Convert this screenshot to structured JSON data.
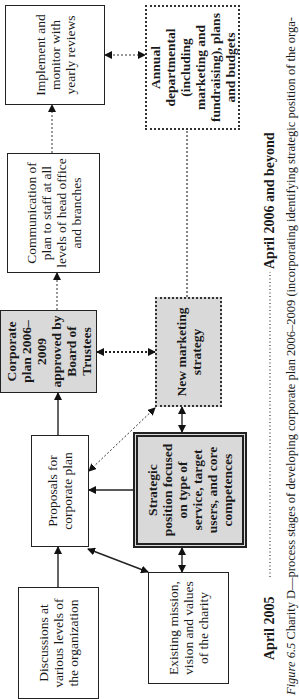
{
  "diagram": {
    "orientation": "rotated 90° counter-clockwise",
    "boxes": {
      "discussions": "Discussions at various levels of the organization",
      "existing_mission": "Existing mission, vision and values of the charity",
      "proposals": "Proposals for corporate plan",
      "strategic_position": "Strategic position focused on type of service, target users, and core competences",
      "corporate_plan": "Corporate plan 2006–2009 approved by Board of Trustees",
      "new_marketing": "New marketing strategy",
      "communication": "Communication of plan to staff at all levels of head office and branches",
      "annual_departmental": "Annual departmental (including marketing and fundraising), plans and budgets",
      "implement": "Implement and monitor with yearly reviews"
    },
    "timeline": {
      "start_label": "April 2005",
      "end_label": "April 2006 and beyond"
    },
    "connections": [
      {
        "from": "discussions",
        "to": "proposals",
        "style": "solid",
        "direction": "forward"
      },
      {
        "from": "proposals",
        "to": "existing_mission",
        "style": "solid",
        "direction": "both"
      },
      {
        "from": "strategic_position",
        "to": "proposals",
        "style": "solid",
        "direction": "forward"
      },
      {
        "from": "existing_mission",
        "to": "strategic_position",
        "style": "solid",
        "direction": "both"
      },
      {
        "from": "strategic_position",
        "to": "new_marketing",
        "style": "solid",
        "direction": "both"
      },
      {
        "from": "new_marketing",
        "to": "proposals",
        "style": "dotted",
        "direction": "both"
      },
      {
        "from": "proposals",
        "to": "corporate_plan",
        "style": "solid",
        "direction": "forward"
      },
      {
        "from": "corporate_plan",
        "to": "new_marketing",
        "style": "dotted",
        "direction": "both"
      },
      {
        "from": "corporate_plan",
        "to": "communication",
        "style": "dotted",
        "direction": "forward"
      },
      {
        "from": "communication",
        "to": "implement",
        "style": "dotted",
        "direction": "forward"
      },
      {
        "from": "implement",
        "to": "annual_departmental",
        "style": "dotted",
        "direction": "both"
      },
      {
        "from": "new_marketing",
        "to": "annual_departmental",
        "style": "dotted",
        "direction": "none"
      }
    ]
  },
  "caption": {
    "figure_label": "Figure 6.5",
    "text_line1": "Charity D—process stages of developing corporate plan 2006–2009 (incorporating identifying strategic position of the orga-"
  }
}
